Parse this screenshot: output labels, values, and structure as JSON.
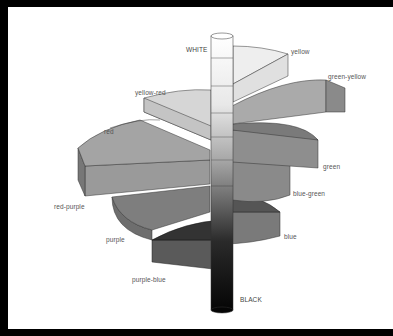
{
  "diagram": {
    "axis": {
      "top_label": "WHITE",
      "bottom_label": "BLACK"
    },
    "hues": [
      {
        "name": "yellow",
        "label": "yellow"
      },
      {
        "name": "green-yellow",
        "label": "green-yellow"
      },
      {
        "name": "green",
        "label": "green"
      },
      {
        "name": "blue-green",
        "label": "blue-green"
      },
      {
        "name": "blue",
        "label": "blue"
      },
      {
        "name": "purple-blue",
        "label": "purple-blue"
      },
      {
        "name": "purple",
        "label": "purple"
      },
      {
        "name": "red-purple",
        "label": "red-purple"
      },
      {
        "name": "red",
        "label": "red"
      },
      {
        "name": "yellow-red",
        "label": "yellow-red"
      }
    ],
    "colors": {
      "frame": "#000000",
      "background": "#ffffff",
      "label": "#555555"
    }
  }
}
